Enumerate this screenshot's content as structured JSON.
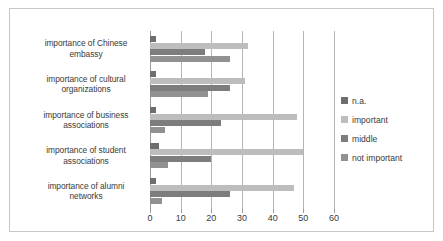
{
  "chart_data": {
    "type": "bar",
    "orientation": "horizontal",
    "title": "",
    "subtitle": "",
    "xlabel": "",
    "ylabel": "",
    "xlim": [
      0,
      60
    ],
    "xticks": [
      "0",
      "10",
      "20",
      "30",
      "40",
      "50",
      "60"
    ],
    "xtick_values": [
      0,
      10,
      20,
      30,
      40,
      50,
      60
    ],
    "grid": true,
    "grid_axis": "x",
    "legend_position": "right",
    "categories": [
      "importance of Chinese embassy",
      "importance of cultural organizations",
      "importance of business associations",
      "importance of student associations",
      "importance of alumni networks"
    ],
    "category_lines": [
      [
        "importance of Chinese",
        "embassy"
      ],
      [
        "importance of cultural",
        "organizations"
      ],
      [
        "importance of business",
        "associations"
      ],
      [
        "importance of student",
        "associations"
      ],
      [
        "importance of alumni",
        "networks"
      ]
    ],
    "series": [
      {
        "name": "n.a.",
        "color": "#6e6e6e",
        "values": [
          2,
          2,
          2,
          3,
          2
        ]
      },
      {
        "name": "important",
        "color": "#bdbdbd",
        "values": [
          32,
          31,
          48,
          50,
          47
        ]
      },
      {
        "name": "middle",
        "color": "#7d7d7d",
        "values": [
          18,
          26,
          23,
          20,
          26
        ]
      },
      {
        "name": "not important",
        "color": "#919191",
        "values": [
          26,
          19,
          5,
          6,
          4
        ]
      }
    ]
  },
  "legend": {
    "items": [
      {
        "label": "n.a.",
        "color": "#6e6e6e"
      },
      {
        "label": "important",
        "color": "#bdbdbd"
      },
      {
        "label": "middle",
        "color": "#7d7d7d"
      },
      {
        "label": "not important",
        "color": "#919191"
      }
    ]
  },
  "colors": {
    "frame_border": "#c6c6c6",
    "gridline": "#b5b5b5",
    "axis": "#9a9a9a",
    "text": "#3a3a3a",
    "background": "#ffffff"
  }
}
